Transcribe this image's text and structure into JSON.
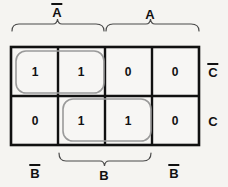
{
  "figure": {
    "kind": "karnaugh-map",
    "rows": 2,
    "columns": 4,
    "grid_color": "#111111",
    "group_color": "#9a9a9a",
    "background_color": "#f5f4f1",
    "text_color": "#111111"
  },
  "top_labels": [
    {
      "id": "a-not",
      "text": "A",
      "overbar": true,
      "spans_columns": [
        1,
        2
      ],
      "x": 57,
      "y": 12
    },
    {
      "id": "a",
      "text": "A",
      "overbar": false,
      "spans_columns": [
        3,
        4
      ],
      "x": 150,
      "y": 14
    }
  ],
  "right_labels": [
    {
      "id": "c-not",
      "text": "C",
      "overbar": true,
      "row": 1,
      "x": 213,
      "y": 72
    },
    {
      "id": "c",
      "text": "C",
      "overbar": false,
      "row": 2,
      "x": 213,
      "y": 121
    }
  ],
  "bottom_labels": [
    {
      "id": "b-not-left",
      "text": "B",
      "overbar": true,
      "spans_columns": [
        1
      ],
      "x": 35,
      "y": 173
    },
    {
      "id": "b",
      "text": "B",
      "overbar": false,
      "spans_columns": [
        2,
        3
      ],
      "x": 104,
      "y": 175
    },
    {
      "id": "b-not-right",
      "text": "B",
      "overbar": true,
      "spans_columns": [
        4
      ],
      "x": 174,
      "y": 173
    }
  ],
  "braces": [
    {
      "id": "brace-a-not",
      "orientation": "down",
      "x1": 12,
      "x2": 104,
      "y": 31,
      "tip_y": 24
    },
    {
      "id": "brace-a",
      "orientation": "down",
      "x1": 106,
      "x2": 199,
      "y": 31,
      "tip_y": 24
    },
    {
      "id": "brace-b",
      "orientation": "up",
      "x1": 59,
      "x2": 151,
      "y": 153,
      "tip_y": 161
    }
  ],
  "cells": [
    {
      "row": 1,
      "col": 1,
      "value": "1",
      "cx": 35,
      "cy": 72
    },
    {
      "row": 1,
      "col": 2,
      "value": "1",
      "cx": 81,
      "cy": 72
    },
    {
      "row": 1,
      "col": 3,
      "value": "0",
      "cx": 128,
      "cy": 72
    },
    {
      "row": 1,
      "col": 4,
      "value": "0",
      "cx": 175,
      "cy": 72
    },
    {
      "row": 2,
      "col": 1,
      "value": "0",
      "cx": 35,
      "cy": 121
    },
    {
      "row": 2,
      "col": 2,
      "value": "1",
      "cx": 81,
      "cy": 121
    },
    {
      "row": 2,
      "col": 3,
      "value": "1",
      "cx": 128,
      "cy": 121
    },
    {
      "row": 2,
      "col": 4,
      "value": "0",
      "cx": 175,
      "cy": 121
    }
  ],
  "groups": [
    {
      "id": "group-top",
      "covers_cells": [
        "r1c1",
        "r1c2"
      ],
      "x": 16,
      "y": 51,
      "width": 88,
      "height": 42,
      "radius": 10
    },
    {
      "id": "group-bottom",
      "covers_cells": [
        "r2c2",
        "r2c3"
      ],
      "x": 63,
      "y": 99,
      "width": 88,
      "height": 42,
      "radius": 10
    }
  ],
  "grid_geometry": {
    "left": 11,
    "top": 47,
    "right": 199,
    "bottom": 145,
    "col_dividers": [
      58,
      105,
      152
    ],
    "row_divider": 96
  }
}
